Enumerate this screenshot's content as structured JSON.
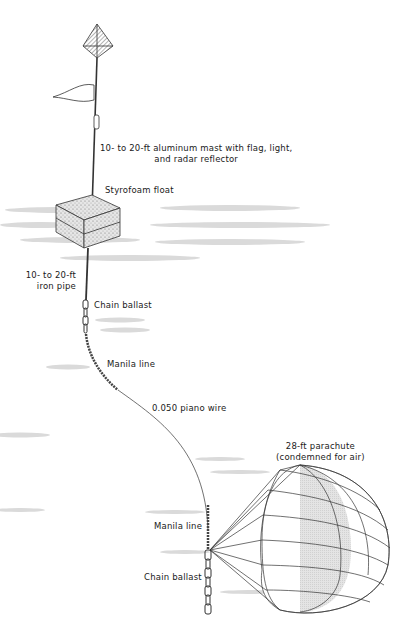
{
  "diagram": {
    "type": "buoy-and-drogue-rig",
    "labels": {
      "mast": [
        "10- to 20-ft aluminum mast with flag, light,",
        "and radar reflector"
      ],
      "float": "Styrofoam float",
      "pipe": [
        "10- to 20-ft",
        "iron pipe"
      ],
      "chain_upper": "Chain ballast",
      "manila_upper": "Manila line",
      "wire": "0.050 piano wire",
      "parachute": [
        "28-ft parachute",
        "(condemned for air)"
      ],
      "manila_lower": "Manila line",
      "chain_lower": "Chain ballast"
    },
    "colors": {
      "ink": "#2a2a2a",
      "water": "#d4d4d4",
      "panel_shade": "#c8c8c8",
      "background": "#ffffff"
    }
  }
}
